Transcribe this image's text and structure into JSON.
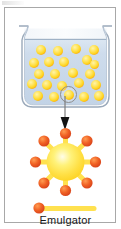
{
  "figure": {
    "caption": "Emulgator",
    "title": ""
  },
  "colors": {
    "droplet_core": "#ffe14f",
    "droplet_rim": "#f08a1e",
    "micelle_body": "#ffe14f",
    "micelle_head": "#ef5a28",
    "beaker_fill": "#c9d8e8",
    "beaker_glass": "#aebfd2",
    "frame_border": "#a8a8a8",
    "label_text": "#171717",
    "arrow": "#111111"
  },
  "beaker": {
    "name": "beaker",
    "liquid_label": "",
    "droplet_count": 24,
    "droplets": [
      {
        "x": 20,
        "y": 21,
        "size": "normal"
      },
      {
        "x": 37,
        "y": 22,
        "size": "normal"
      },
      {
        "x": 55,
        "y": 20,
        "size": "normal"
      },
      {
        "x": 73,
        "y": 21,
        "size": "normal"
      },
      {
        "x": 13,
        "y": 34,
        "size": "normal"
      },
      {
        "x": 28,
        "y": 33,
        "size": "normal"
      },
      {
        "x": 43,
        "y": 33,
        "size": "normal"
      },
      {
        "x": 66,
        "y": 32,
        "size": "normal"
      },
      {
        "x": 73,
        "y": 36,
        "size": "small"
      },
      {
        "x": 18,
        "y": 45,
        "size": "normal"
      },
      {
        "x": 34,
        "y": 45,
        "size": "normal"
      },
      {
        "x": 52,
        "y": 44,
        "size": "normal"
      },
      {
        "x": 69,
        "y": 45,
        "size": "normal"
      },
      {
        "x": 11,
        "y": 55,
        "size": "normal"
      },
      {
        "x": 26,
        "y": 56,
        "size": "normal"
      },
      {
        "x": 41,
        "y": 57,
        "size": "normal"
      },
      {
        "x": 58,
        "y": 54,
        "size": "normal"
      },
      {
        "x": 75,
        "y": 56,
        "size": "normal"
      },
      {
        "x": 17,
        "y": 67,
        "size": "normal"
      },
      {
        "x": 33,
        "y": 68,
        "size": "normal"
      },
      {
        "x": 48,
        "y": 66,
        "size": "normal"
      },
      {
        "x": 63,
        "y": 68,
        "size": "normal"
      },
      {
        "x": 78,
        "y": 67,
        "size": "normal"
      },
      {
        "x": 10,
        "y": 44,
        "size": "small"
      }
    ],
    "selected_droplet": {
      "x": 48,
      "y": 66
    }
  },
  "arrow": {
    "name": "callout-arrow",
    "direction": "down",
    "label": ""
  },
  "micelle": {
    "name": "micelle-diagram",
    "arm_count": 8,
    "arms": [
      {
        "angle": 90,
        "label": ""
      },
      {
        "angle": 45,
        "label": ""
      },
      {
        "angle": 0,
        "label": ""
      },
      {
        "angle": 315,
        "label": ""
      },
      {
        "angle": 270,
        "label": ""
      },
      {
        "angle": 225,
        "label": ""
      },
      {
        "angle": 180,
        "label": ""
      },
      {
        "angle": 135,
        "label": ""
      }
    ]
  },
  "legend": {
    "name": "legend",
    "label": "Emulgator",
    "symbol": "emulgator-molecule",
    "symbol_description": "round head with straight tail"
  }
}
